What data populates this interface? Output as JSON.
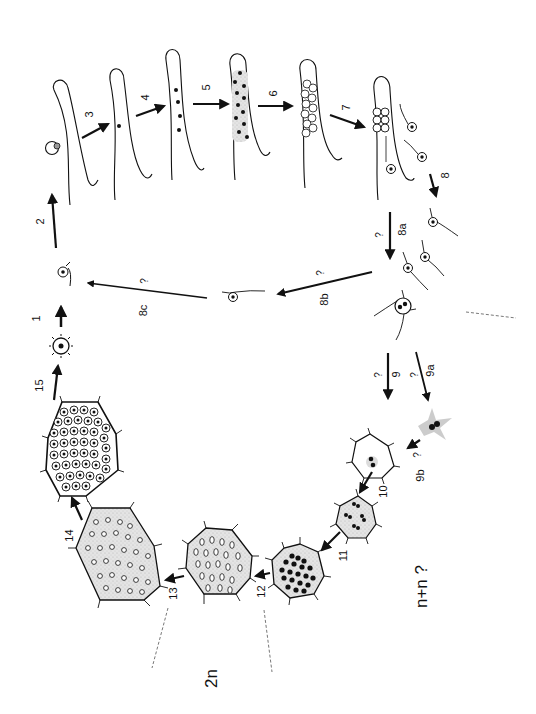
{
  "diagram": {
    "title": "",
    "orientation": "rotated 90° counter-clockwise",
    "ploidy_labels": {
      "diploid": "2n",
      "dikaryon": "n+n ?"
    },
    "steps": [
      {
        "id": "1",
        "label": "1"
      },
      {
        "id": "2",
        "label": "2"
      },
      {
        "id": "3",
        "label": "3"
      },
      {
        "id": "4",
        "label": "4"
      },
      {
        "id": "5",
        "label": "5"
      },
      {
        "id": "6",
        "label": "6"
      },
      {
        "id": "7",
        "label": "7"
      },
      {
        "id": "8",
        "label": "8"
      },
      {
        "id": "8a",
        "label": "8a",
        "uncertain": "?"
      },
      {
        "id": "8b",
        "label": "8b",
        "uncertain": "?"
      },
      {
        "id": "8c",
        "label": "8c",
        "uncertain": "?"
      },
      {
        "id": "9",
        "label": "9",
        "uncertain": "?"
      },
      {
        "id": "9a",
        "label": "9a",
        "uncertain": "?"
      },
      {
        "id": "9b",
        "label": "9b",
        "uncertain": "?"
      },
      {
        "id": "10",
        "label": "10"
      },
      {
        "id": "11",
        "label": "11"
      },
      {
        "id": "12",
        "label": "12"
      },
      {
        "id": "13",
        "label": "13"
      },
      {
        "id": "14",
        "label": "14"
      },
      {
        "id": "15",
        "label": "15"
      }
    ],
    "uncertain_mark": "?"
  }
}
